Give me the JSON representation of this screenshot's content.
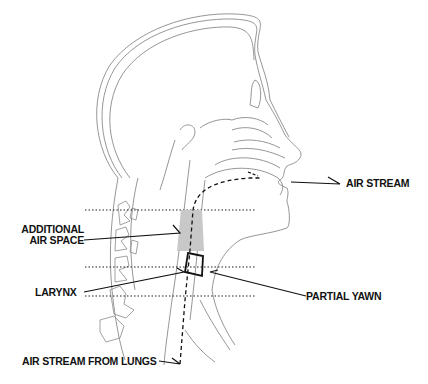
{
  "diagram": {
    "type": "anatomical cross-section of head and neck (sagittal)",
    "labels": {
      "air_stream": "AIR STREAM",
      "additional_air_space_line1": "ADDITIONAL",
      "additional_air_space_line2": "AIR SPACE",
      "larynx": "LARYNX",
      "partial_yawn": "PARTIAL YAWN",
      "air_stream_from_lungs": "AIR STREAM FROM LUNGS"
    },
    "colors": {
      "outline": "#8a8a8a",
      "ink": "#111111",
      "air_space_fill": "#c8c8c8"
    }
  }
}
